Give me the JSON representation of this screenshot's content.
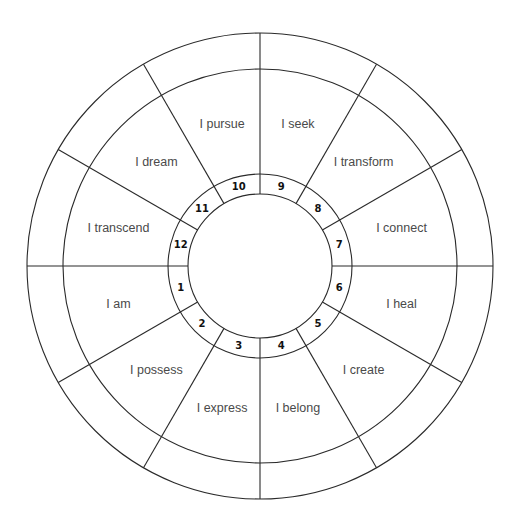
{
  "diagram": {
    "type": "house-wheel",
    "center": [
      260,
      266
    ],
    "radii": {
      "inner": 72,
      "number_ring": 92,
      "label_ring": 197,
      "outer": 233
    },
    "spoke_count": 12,
    "colors": {
      "line": "#2a2a2a",
      "label": "#4a4a4a",
      "number": "#111111",
      "background": "#ffffff"
    },
    "houses": [
      {
        "number": "1",
        "label": "I am"
      },
      {
        "number": "2",
        "label": "I possess"
      },
      {
        "number": "3",
        "label": "I express"
      },
      {
        "number": "4",
        "label": "I belong"
      },
      {
        "number": "5",
        "label": "I create"
      },
      {
        "number": "6",
        "label": "I heal"
      },
      {
        "number": "7",
        "label": "I connect"
      },
      {
        "number": "8",
        "label": "I transform"
      },
      {
        "number": "9",
        "label": "I seek"
      },
      {
        "number": "10",
        "label": "I pursue"
      },
      {
        "number": "11",
        "label": "I dream"
      },
      {
        "number": "12",
        "label": "I transcend"
      }
    ]
  }
}
